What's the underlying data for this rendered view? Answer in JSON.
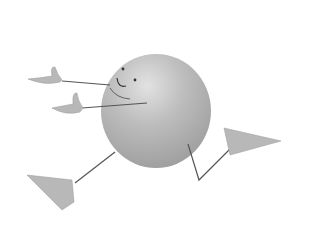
{
  "illustration": {
    "subject": "running round cartoon character",
    "colors": {
      "background": "#ffffff",
      "body": "#b4b4b4",
      "body_highlight": "#dcdcdc",
      "limb": "#555555",
      "hand_foot": "#b8b8b8"
    }
  }
}
